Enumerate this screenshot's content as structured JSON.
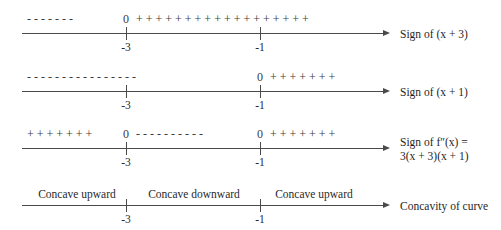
{
  "figure": {
    "axis_color": "#4a4a4a",
    "text_color": "#2a2a2a",
    "background": "#ffffff",
    "tick_values": [
      "-3",
      "-1"
    ]
  },
  "rows": [
    {
      "id": "sign-of-x-plus-3",
      "signs_before": "- - - - - - -",
      "zero_at_neg3": "0",
      "signs_middle": "+ + + + + + + + + + + + + + + + + +",
      "zero_at_neg1": "",
      "signs_after": "",
      "tick_left": "-3",
      "tick_right": "-1",
      "label_line1": "Sign of (x + 3)",
      "label_line2": ""
    },
    {
      "id": "sign-of-x-plus-1",
      "signs_before": "- - - - - - - - - - - - - - - -",
      "zero_at_neg3": "",
      "signs_middle": "",
      "zero_at_neg1": "0",
      "signs_after": "+ + + + + + +",
      "tick_left": "-3",
      "tick_right": "-1",
      "label_line1": "Sign of (x + 1)",
      "label_line2": ""
    },
    {
      "id": "sign-of-second-derivative",
      "signs_before": "+ + + + + + +",
      "zero_at_neg3": "0",
      "signs_middle": "- - - - - - - - - -",
      "zero_at_neg1": "0",
      "signs_after": "+ + + + + + +",
      "tick_left": "-3",
      "tick_right": "-1",
      "label_line1": "Sign of f″(x) =",
      "label_line2": "3(x + 3)(x + 1)"
    },
    {
      "id": "concavity-of-curve",
      "interval_left": "Concave upward",
      "interval_middle": "Concave downward",
      "interval_right": "Concave upward",
      "tick_left": "-3",
      "tick_right": "-1",
      "label_line1": "Concavity of curve",
      "label_line2": ""
    }
  ]
}
